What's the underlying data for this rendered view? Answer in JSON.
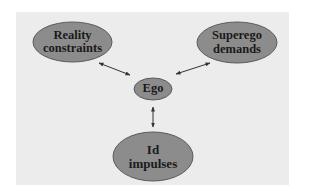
{
  "diagram": {
    "type": "concept-diagram",
    "colors": {
      "page_background": "#ffffff",
      "panel_background": "#ececec",
      "node_fill": "#8c8c8c",
      "node_stroke": "#5a5a5a",
      "arrow": "#333333",
      "text": "#1a1a1a"
    },
    "nodes": [
      {
        "id": "reality",
        "line1": "Reality",
        "line2": "constraints"
      },
      {
        "id": "superego",
        "line1": "Superego",
        "line2": "demands"
      },
      {
        "id": "ego",
        "line1": "Ego",
        "line2": ""
      },
      {
        "id": "id",
        "line1": "Id",
        "line2": "impulses"
      }
    ],
    "edges": [
      {
        "from": "reality",
        "to": "ego",
        "direction": "bidirectional"
      },
      {
        "from": "superego",
        "to": "ego",
        "direction": "bidirectional"
      },
      {
        "from": "id",
        "to": "ego",
        "direction": "bidirectional"
      }
    ]
  }
}
